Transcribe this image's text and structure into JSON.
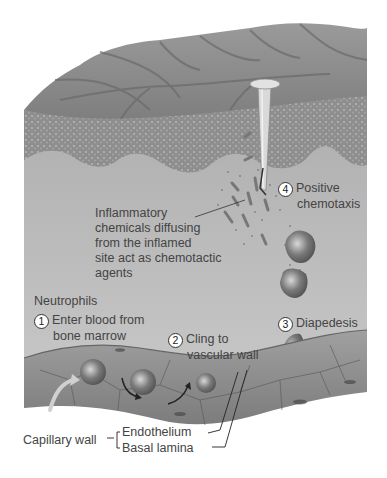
{
  "figure": {
    "colors": {
      "background": "#ffffff",
      "skin_surface": "#8a8a8a",
      "epidermis_texture": "#9a9a9a",
      "tissue": "#b9b9b9",
      "capillary": "#8f8f8f",
      "text": "#444444"
    }
  },
  "labels": {
    "inflammatory": {
      "line1": "Inflammatory",
      "line2": "chemicals diffusing",
      "line3": "from the inflamed",
      "line4": "site act as chemotactic",
      "line5": "agents"
    },
    "neutrophils": "Neutrophils",
    "step1": {
      "num": "1",
      "line1": "Enter blood from",
      "line2": "bone marrow"
    },
    "step2": {
      "num": "2",
      "line1": "Cling to",
      "line2": "vascular wall"
    },
    "step3": {
      "num": "3",
      "line1": "Diapedesis"
    },
    "step4": {
      "num": "4",
      "line1": "Positive",
      "line2": "chemotaxis"
    },
    "capillary_wall": "Capillary wall",
    "endothelium": "Endothelium",
    "basal_lamina": "Basal lamina"
  },
  "icons": {
    "nail": "nail-icon",
    "neutrophil": "neutrophil-cell-icon",
    "arrow": "curved-arrow-icon"
  }
}
